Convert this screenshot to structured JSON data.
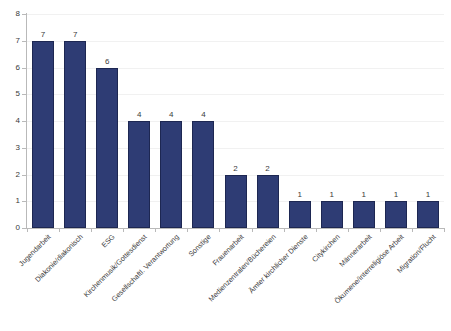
{
  "chart_data": {
    "type": "bar",
    "title": "",
    "subtitle": "",
    "xlabel": "",
    "ylabel": "",
    "ylim": [
      0,
      8
    ],
    "y_ticks": [
      0,
      1,
      2,
      3,
      4,
      5,
      6,
      7,
      8
    ],
    "grid": true,
    "legend": false,
    "legend_position": "none",
    "orientation": "vertical",
    "bar_color": "#2e3c74",
    "bar_border_color": "#1d2752",
    "axis_color": "#b9b9b9",
    "gridline_color": "#f1f1f1",
    "label_rotation_degrees": -45,
    "categories": [
      "Jugendarbeit",
      "Diakonie/diakonisch",
      "ESG",
      "Kirchenmusik/Gottesdienst",
      "Gesellschaftl. Verantwortung",
      "Sonstige",
      "Frauenarbeit",
      "Medienzentralen/Büchereien",
      "Ämter kirchlicher Dienste",
      "Citykirchen",
      "Männerarbeit",
      "Ökumene/interreligiöse Arbeit",
      "Migration/Flucht"
    ],
    "values": [
      7,
      7,
      6,
      4,
      4,
      4,
      2,
      2,
      1,
      1,
      1,
      1,
      1
    ],
    "data_labels": [
      "7",
      "7",
      "6",
      "4",
      "4",
      "4",
      "2",
      "2",
      "1",
      "1",
      "1",
      "1",
      "1"
    ],
    "y_tick_labels": [
      "0",
      "1",
      "2",
      "3",
      "4",
      "5",
      "6",
      "7",
      "8"
    ]
  }
}
